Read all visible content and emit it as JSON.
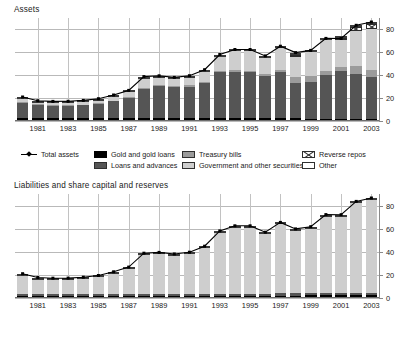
{
  "assets": {
    "title": "Assets",
    "legend": {
      "line_label": "Total assets",
      "items": [
        {
          "label": "Gold and gold loans",
          "fill": "black"
        },
        {
          "label": "Loans and advances",
          "fill": "dark"
        },
        {
          "label": "Treasury bills",
          "fill": "mid"
        },
        {
          "label": "Government and other securities",
          "fill": "light"
        },
        {
          "label": "Reverse repos",
          "fill": "repo"
        },
        {
          "label": "Other",
          "fill": "white"
        }
      ]
    }
  },
  "liabilities": {
    "title": "Liabilities and share capital and reserves",
    "legend": {
      "line_label": "Total liabilities and share capital and reserves",
      "items": [
        {
          "label": "Share capital and reserves",
          "fill": "black"
        },
        {
          "label": "Gold deposits",
          "fill": "dark"
        },
        {
          "label": "Currency deposits",
          "fill": "light"
        },
        {
          "label": "Other",
          "fill": "white"
        }
      ]
    }
  },
  "chart_data": [
    {
      "type": "bar",
      "title": "Assets",
      "xlabel": "",
      "ylabel": "",
      "ylim": [
        0,
        90
      ],
      "yticks": [
        0,
        20,
        40,
        60,
        80
      ],
      "grid": true,
      "legend_position": "bottom",
      "x": [
        1980,
        1981,
        1982,
        1983,
        1984,
        1985,
        1986,
        1987,
        1988,
        1989,
        1990,
        1991,
        1992,
        1993,
        1994,
        1995,
        1996,
        1997,
        1998,
        1999,
        2000,
        2001,
        2002,
        2003
      ],
      "tick_labels": [
        "1981",
        "1983",
        "1985",
        "1987",
        "1989",
        "1991",
        "1993",
        "1995",
        "1997",
        "1999",
        "2001",
        "2003"
      ],
      "series": [
        {
          "name": "Gold and gold loans",
          "values": [
            3.0,
            2.8,
            2.6,
            2.6,
            2.6,
            2.7,
            2.7,
            2.7,
            2.8,
            2.7,
            2.6,
            2.6,
            2.6,
            2.6,
            2.5,
            2.5,
            2.4,
            2.4,
            2.3,
            2.2,
            2.2,
            2.1,
            2.1,
            2.0
          ]
        },
        {
          "name": "Loans and advances",
          "values": [
            14.0,
            12.5,
            12.0,
            12.0,
            12.5,
            13.5,
            15.5,
            18.5,
            26.0,
            29.0,
            28.0,
            28.5,
            31.5,
            41.0,
            41.5,
            41.0,
            38.0,
            41.5,
            32.0,
            33.0,
            39.0,
            42.0,
            40.0,
            37.0
          ]
        },
        {
          "name": "Treasury bills",
          "values": [
            0.5,
            0.4,
            0.4,
            0.4,
            0.5,
            0.6,
            0.7,
            0.8,
            1.0,
            1.0,
            1.0,
            1.0,
            1.2,
            1.5,
            1.5,
            1.5,
            1.5,
            1.5,
            5.0,
            5.0,
            3.5,
            3.5,
            6.5,
            6.0
          ]
        },
        {
          "name": "Government and other securities",
          "values": [
            3.0,
            1.6,
            1.7,
            1.8,
            2.0,
            2.3,
            3.3,
            4.2,
            8.5,
            6.3,
            6.0,
            7.0,
            9.0,
            12.5,
            16.5,
            17.0,
            14.5,
            19.5,
            18.5,
            21.0,
            27.0,
            24.0,
            31.5,
            36.5
          ]
        },
        {
          "name": "Reverse repos",
          "values": [
            0,
            0,
            0,
            0,
            0,
            0,
            0,
            0,
            0,
            0,
            0,
            0,
            0,
            0,
            0,
            0,
            0,
            0,
            1.5,
            0,
            0,
            2.0,
            3.0,
            4.5
          ]
        },
        {
          "name": "Other",
          "values": [
            0.5,
            0.4,
            0.4,
            0.4,
            0.4,
            0.4,
            0.5,
            0.5,
            0.5,
            0.5,
            0.5,
            0.5,
            0.5,
            0.5,
            0.5,
            0.5,
            0.5,
            0.5,
            0.5,
            0.5,
            0.5,
            0.5,
            0.5,
            0.5
          ]
        }
      ],
      "line": {
        "name": "Total assets",
        "values": [
          21.0,
          17.7,
          17.1,
          17.2,
          18.0,
          19.5,
          22.7,
          26.7,
          38.8,
          39.5,
          38.1,
          39.6,
          44.8,
          58.1,
          62.5,
          62.5,
          56.9,
          65.4,
          59.8,
          61.7,
          72.2,
          72.1,
          83.6,
          86.5
        ]
      }
    },
    {
      "type": "bar",
      "title": "Liabilities and share capital and reserves",
      "xlabel": "",
      "ylabel": "",
      "ylim": [
        0,
        90
      ],
      "yticks": [
        0,
        20,
        40,
        60,
        80
      ],
      "grid": true,
      "legend_position": "bottom",
      "x": [
        1980,
        1981,
        1982,
        1983,
        1984,
        1985,
        1986,
        1987,
        1988,
        1989,
        1990,
        1991,
        1992,
        1993,
        1994,
        1995,
        1996,
        1997,
        1998,
        1999,
        2000,
        2001,
        2002,
        2003
      ],
      "tick_labels": [
        "1981",
        "1983",
        "1985",
        "1987",
        "1989",
        "1991",
        "1993",
        "1995",
        "1997",
        "1999",
        "2001",
        "2003"
      ],
      "series": [
        {
          "name": "Share capital and reserves",
          "values": [
            1.6,
            1.5,
            1.5,
            1.5,
            1.5,
            1.5,
            1.6,
            1.6,
            1.7,
            1.7,
            1.7,
            1.8,
            1.8,
            2.0,
            2.0,
            2.0,
            2.0,
            2.2,
            2.2,
            2.3,
            2.5,
            2.6,
            2.8,
            3.0
          ]
        },
        {
          "name": "Gold deposits",
          "values": [
            2.2,
            2.1,
            2.0,
            2.0,
            2.0,
            2.0,
            2.0,
            2.0,
            2.0,
            2.0,
            2.0,
            2.0,
            2.0,
            2.0,
            2.0,
            2.0,
            1.9,
            1.9,
            1.8,
            1.8,
            1.8,
            1.8,
            1.8,
            1.8
          ]
        },
        {
          "name": "Currency deposits",
          "values": [
            16.7,
            13.6,
            13.1,
            13.2,
            14.0,
            15.5,
            18.6,
            22.6,
            34.6,
            35.3,
            33.9,
            35.3,
            40.5,
            53.6,
            58.0,
            58.0,
            52.5,
            60.8,
            55.3,
            57.1,
            67.4,
            67.2,
            78.5,
            81.2
          ]
        },
        {
          "name": "Other",
          "values": [
            0.5,
            0.5,
            0.5,
            0.5,
            0.5,
            0.5,
            0.5,
            0.5,
            0.5,
            0.5,
            0.5,
            0.5,
            0.5,
            0.5,
            0.5,
            0.5,
            0.5,
            0.5,
            0.5,
            0.5,
            0.5,
            0.5,
            0.5,
            0.5
          ]
        }
      ],
      "line": {
        "name": "Total liabilities and share capital and reserves",
        "values": [
          21.0,
          17.7,
          17.1,
          17.2,
          18.0,
          19.5,
          22.7,
          26.7,
          38.8,
          39.5,
          38.1,
          39.6,
          44.8,
          58.1,
          62.5,
          62.5,
          56.9,
          65.4,
          59.8,
          61.7,
          72.2,
          72.1,
          83.6,
          86.5
        ]
      }
    }
  ]
}
